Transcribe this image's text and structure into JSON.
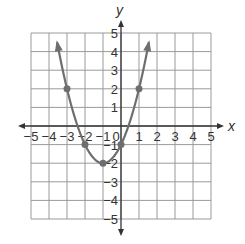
{
  "chart_data": {
    "type": "line",
    "title": "",
    "xlabel": "x",
    "ylabel": "y",
    "xlim": [
      -5,
      5
    ],
    "ylim": [
      -5,
      5
    ],
    "grid": true,
    "x_ticks": [
      "−5",
      "−4",
      "−3",
      "−2",
      "−1",
      "0",
      "1",
      "2",
      "3",
      "4",
      "5"
    ],
    "y_ticks": [
      "5",
      "4",
      "3",
      "2",
      "1",
      "−1",
      "−2",
      "−3",
      "−4",
      "−5"
    ],
    "series": [
      {
        "name": "parabola",
        "equation": "y = (x+1)^2 - 2",
        "curve_color": "#6e6e6e",
        "points": [
          {
            "x": -3,
            "y": 2
          },
          {
            "x": -2,
            "y": -1
          },
          {
            "x": -1,
            "y": -2
          },
          {
            "x": 0,
            "y": -1
          },
          {
            "x": 1,
            "y": 2
          }
        ],
        "arrows_at_ends": true
      }
    ]
  },
  "axes": {
    "x_label": "x",
    "y_label": "y",
    "origin_label": "0"
  }
}
